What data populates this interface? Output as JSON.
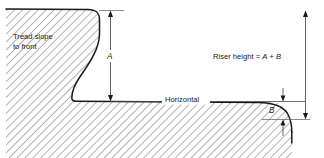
{
  "figure": {
    "kind": "engineering-section-diagram",
    "background_color": "#ffffff",
    "line_color": "#1a1a1a",
    "hatch_color": "#262626",
    "dimension_color": "#3a3a3a"
  },
  "labels": {
    "tread_slope_line1": "Tread slope",
    "tread_slope_line2": "to front",
    "dimension_a": "A",
    "dimension_b": "B",
    "horizontal": "Horizontal",
    "riser_height_prefix": "Riser height = ",
    "riser_height_a": "A",
    "riser_height_plus": " + ",
    "riser_height_b": "B",
    "riser_height_full": "Riser height = A + B"
  },
  "geometry": {
    "canvas_width": 324,
    "canvas_height": 158,
    "top_surface_y": 10,
    "tread_surface_y": 101,
    "tread_bottom_y": 119,
    "riser_face_top_x": 98,
    "riser_face_bottom_x": 72,
    "nose_end_x": 292,
    "nose_end_y": 131,
    "dim_a_x": 110,
    "dim_total_x": 305,
    "dim_b_x": 283,
    "hatch_spacing": 6,
    "hatch_angle_deg": 45
  }
}
